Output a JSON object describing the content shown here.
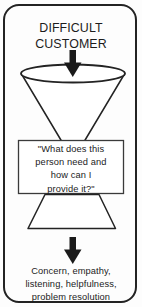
{
  "diagram": {
    "title_block": {
      "line1": "DIFFICULT",
      "line2": "CUSTOMER",
      "text": "DIFFICULT\nCUSTOMER"
    },
    "question_block": {
      "line1": "\"What does this",
      "line2": "person need and",
      "line3": "how can I",
      "line4": "provide it?\"",
      "text": "\"What does this\nperson need and\nhow can I\nprovide it?\""
    },
    "outcome_block": {
      "line1": "Concern, empathy,",
      "line2": "listening, helpfulness,",
      "line3": "problem resolution",
      "text": "Concern, empathy,\nlistening, helpfulness,\nproblem resolution"
    },
    "shapes": {
      "outer_frame": "rounded-rectangle-border",
      "upper_funnel": "cone-narrowing-downward",
      "funnel_rim": "ellipse",
      "lower_funnel": "trapezoid-widening-downward",
      "arrow_top": "down-arrow",
      "arrow_bottom": "down-arrow",
      "question_box": "rectangle-outline"
    },
    "colors": {
      "stroke": "#232323",
      "text": "#1c1c1c",
      "arrow_fill": "#1a1a1a",
      "background": "#fdfdfd",
      "shape_fill": "#ffffff"
    }
  }
}
